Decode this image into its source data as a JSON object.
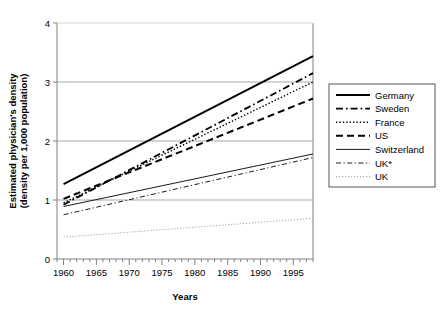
{
  "chart_data": {
    "type": "line",
    "title": "",
    "xlabel": "Years",
    "ylabel": "Estimated physician's density (density per 1,000 population)",
    "ylabel_line1": "Estimated physician's density",
    "ylabel_line2": "(density per 1,000 population)",
    "xlim": [
      1959,
      1998
    ],
    "ylim": [
      0,
      4
    ],
    "x_major_ticks": [
      1960,
      1965,
      1970,
      1975,
      1980,
      1985,
      1990,
      1995
    ],
    "x_major_tick_labels": [
      "1960",
      "1965",
      "1970",
      "1975",
      "1980",
      "1985",
      "1990",
      "1995"
    ],
    "x_minor_tick_step": 1,
    "y_ticks": [
      0,
      1,
      2,
      3,
      4
    ],
    "y_tick_labels": [
      "0",
      "1",
      "2",
      "3",
      "4"
    ],
    "grid": "horizontal",
    "legend_position": "right",
    "x": [
      1960,
      1998
    ],
    "series": [
      {
        "name": "Germany",
        "style": "solid",
        "width": 2.0,
        "color": "#000000",
        "values": [
          1.27,
          3.44
        ]
      },
      {
        "name": "Sweden",
        "style": "dash-dot",
        "width": 1.8,
        "color": "#000000",
        "values": [
          0.92,
          3.15
        ]
      },
      {
        "name": "France",
        "style": "dotted",
        "width": 1.4,
        "color": "#000000",
        "values": [
          0.95,
          3.0
        ]
      },
      {
        "name": "US",
        "style": "dashed",
        "width": 2.0,
        "color": "#000000",
        "values": [
          1.02,
          2.72
        ]
      },
      {
        "name": "Switzerland",
        "style": "solid",
        "width": 0.9,
        "color": "#000000",
        "values": [
          0.89,
          1.78
        ]
      },
      {
        "name": "UK*",
        "style": "dash-dot",
        "width": 0.9,
        "color": "#000000",
        "values": [
          0.75,
          1.72
        ]
      },
      {
        "name": "UK",
        "style": "dotted",
        "width": 0.9,
        "color": "#9a9a9a",
        "values": [
          0.37,
          0.69
        ]
      }
    ]
  },
  "legend": {
    "entries": [
      {
        "label": "Germany"
      },
      {
        "label": "Sweden"
      },
      {
        "label": "France"
      },
      {
        "label": "US"
      },
      {
        "label": "Switzerland"
      },
      {
        "label": "UK*"
      },
      {
        "label": "UK"
      }
    ]
  }
}
